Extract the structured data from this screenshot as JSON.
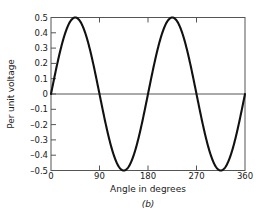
{
  "chart_data": {
    "type": "line",
    "title": "",
    "caption": "(b)",
    "xlabel": "Angle in degrees",
    "ylabel": "Per unit voltage",
    "xlim": [
      0,
      360
    ],
    "ylim": [
      -0.5,
      0.5
    ],
    "grid": false,
    "legend": null,
    "line_color": "#111111",
    "axis_color": "#555555",
    "background": "#ffffff",
    "xticks": [
      {
        "value": 0,
        "label": "0"
      },
      {
        "value": 90,
        "label": "90"
      },
      {
        "value": 180,
        "label": "180"
      },
      {
        "value": 270,
        "label": "270"
      },
      {
        "value": 360,
        "label": "360"
      }
    ],
    "yticks": [
      {
        "value": 0.5,
        "label": "0.5"
      },
      {
        "value": 0.4,
        "label": "0.4"
      },
      {
        "value": 0.3,
        "label": "0.3"
      },
      {
        "value": 0.2,
        "label": "0.2"
      },
      {
        "value": 0.1,
        "label": "0.1"
      },
      {
        "value": 0.0,
        "label": "0"
      },
      {
        "value": -0.1,
        "label": "–0.1"
      },
      {
        "value": -0.2,
        "label": "–0.2"
      },
      {
        "value": -0.3,
        "label": "–0.3"
      },
      {
        "value": -0.4,
        "label": "–0.4"
      },
      {
        "value": -0.5,
        "label": "–0.5"
      }
    ],
    "series": [
      {
        "name": "Per unit voltage",
        "equation": "0.5*sin(2*theta)",
        "x": [
          0,
          10,
          20,
          30,
          40,
          45,
          50,
          60,
          70,
          80,
          90,
          100,
          110,
          120,
          130,
          135,
          140,
          150,
          160,
          170,
          180,
          190,
          200,
          210,
          220,
          225,
          230,
          240,
          250,
          260,
          270,
          280,
          290,
          300,
          310,
          315,
          320,
          330,
          340,
          350,
          360
        ],
        "y": [
          0.0,
          0.171,
          0.321,
          0.433,
          0.492,
          0.5,
          0.492,
          0.433,
          0.321,
          0.171,
          0.0,
          -0.171,
          -0.321,
          -0.433,
          -0.492,
          -0.5,
          -0.492,
          -0.433,
          -0.321,
          -0.171,
          0.0,
          0.171,
          0.321,
          0.433,
          0.492,
          0.5,
          0.492,
          0.433,
          0.321,
          0.171,
          0.0,
          -0.171,
          -0.321,
          -0.433,
          -0.492,
          -0.5,
          -0.492,
          -0.433,
          -0.321,
          -0.171,
          0.0
        ]
      }
    ],
    "annotations": {
      "peaks": [
        {
          "x": 45,
          "y": 0.5
        },
        {
          "x": 225,
          "y": 0.5
        }
      ],
      "troughs": [
        {
          "x": 135,
          "y": -0.5
        },
        {
          "x": 315,
          "y": -0.5
        }
      ],
      "zero_crossings": [
        0,
        90,
        180,
        270,
        360
      ]
    }
  }
}
